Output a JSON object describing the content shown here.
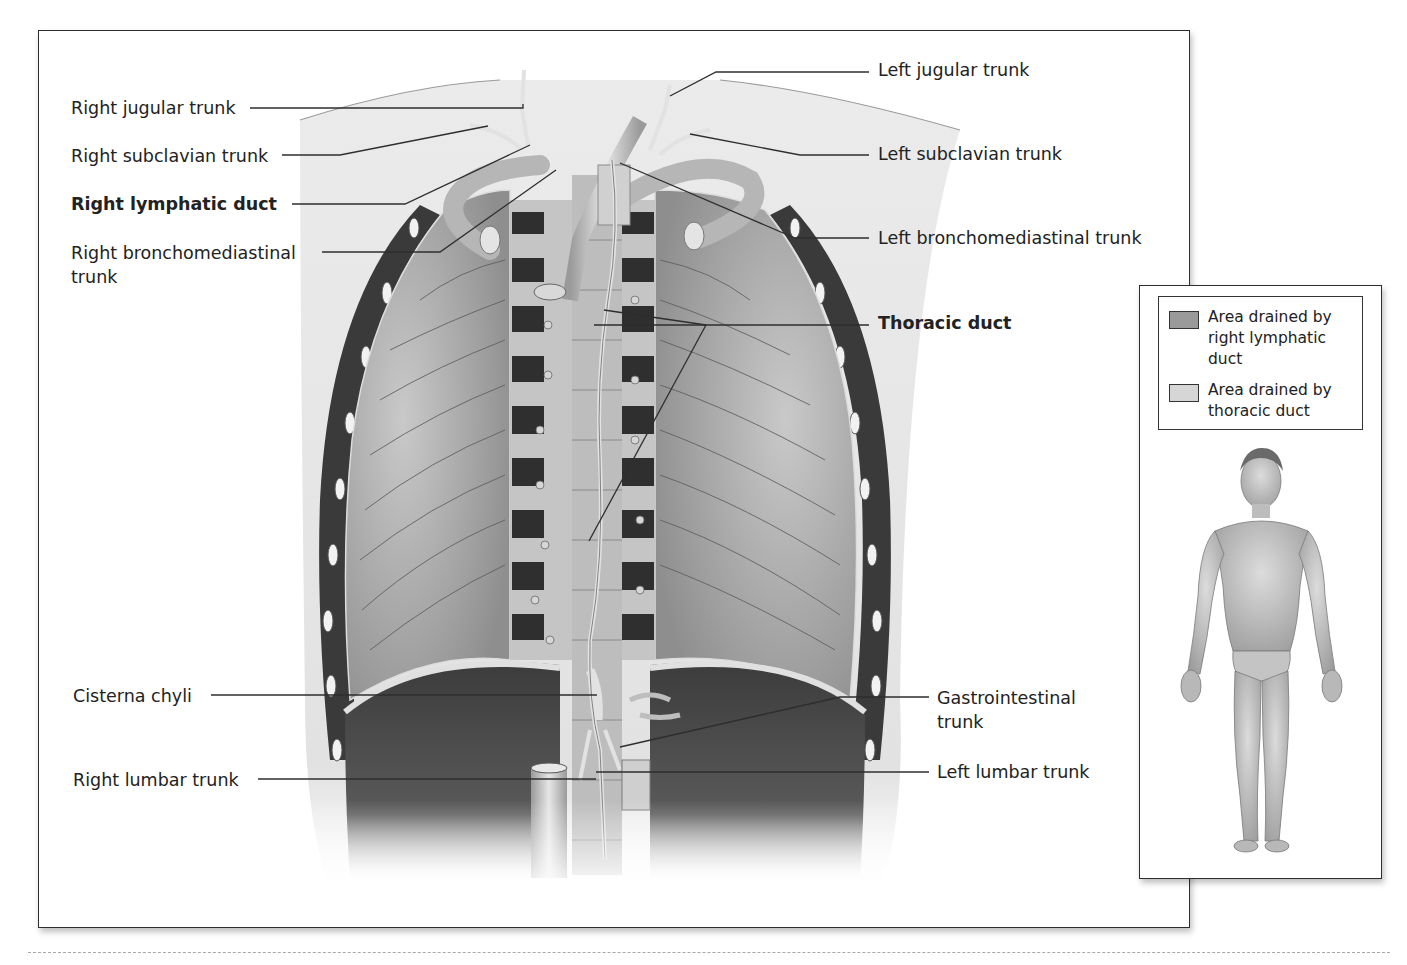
{
  "figure": {
    "colors": {
      "frame_border": "#2e2e2e",
      "lung_fill": "#a9a9a9",
      "dark_intercostal": "#3a3a3a",
      "vessel_fill": "#d2d2d2",
      "leader_line": "#333333",
      "right_duct_area_swatch": "#9a9a9a",
      "thoracic_duct_area_swatch": "#d6d6d6"
    }
  },
  "labels_left": [
    {
      "id": "right-jugular-trunk",
      "text": "Right jugular trunk",
      "bold": false
    },
    {
      "id": "right-subclavian-trunk",
      "text": "Right subclavian trunk",
      "bold": false
    },
    {
      "id": "right-lymphatic-duct",
      "text": "Right lymphatic duct",
      "bold": true
    },
    {
      "id": "right-bronchomediastinal-trunk",
      "text": "Right bronchomediastinal trunk",
      "bold": false
    },
    {
      "id": "cisterna-chyli",
      "text": "Cisterna chyli",
      "bold": false
    },
    {
      "id": "right-lumbar-trunk",
      "text": "Right lumbar trunk",
      "bold": false
    }
  ],
  "labels_right": [
    {
      "id": "left-jugular-trunk",
      "text": "Left jugular trunk",
      "bold": false
    },
    {
      "id": "left-subclavian-trunk",
      "text": "Left subclavian trunk",
      "bold": false
    },
    {
      "id": "left-bronchomediastinal-trunk",
      "text": "Left bronchomediastinal trunk",
      "bold": false
    },
    {
      "id": "thoracic-duct",
      "text": "Thoracic duct",
      "bold": true
    },
    {
      "id": "gastrointestinal-trunk",
      "text": "Gastrointestinal trunk",
      "bold": false
    },
    {
      "id": "left-lumbar-trunk",
      "text": "Left lumbar trunk",
      "bold": false
    }
  ],
  "inset": {
    "legend": [
      {
        "id": "right-lymphatic-area",
        "text": "Area drained by right lymphatic duct",
        "swatch": "#9a9a9a"
      },
      {
        "id": "thoracic-duct-area",
        "text": "Area drained by thoracic duct",
        "swatch": "#d6d6d6"
      }
    ],
    "figure": "Anterior full-body male figure"
  }
}
